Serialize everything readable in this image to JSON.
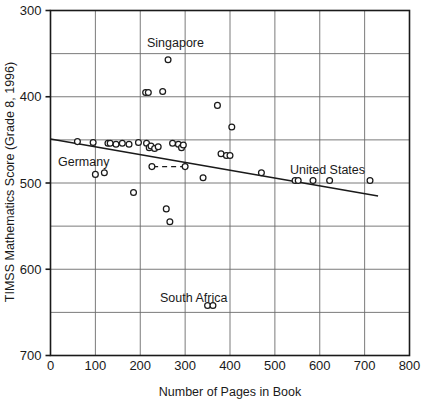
{
  "chart_data": {
    "type": "scatter",
    "title": "",
    "xlabel": "Number of Pages in Book",
    "ylabel": "TIMSS Mathematics Score (Grade 8, 1996)",
    "xlim": [
      0,
      800
    ],
    "ylim": [
      300,
      700
    ],
    "xticks": [
      0,
      100,
      200,
      300,
      400,
      500,
      600,
      700,
      800
    ],
    "yticks": [
      300,
      400,
      500,
      600,
      700
    ],
    "y_minor_gridlines": [
      350,
      450,
      550,
      650
    ],
    "grid": true,
    "legend": "none",
    "point_marker": "open-circle",
    "points": [
      {
        "x": 60,
        "y": 548
      },
      {
        "x": 95,
        "y": 547
      },
      {
        "x": 100,
        "y": 510
      },
      {
        "x": 120,
        "y": 512
      },
      {
        "x": 128,
        "y": 546
      },
      {
        "x": 133,
        "y": 546
      },
      {
        "x": 146,
        "y": 545
      },
      {
        "x": 160,
        "y": 546
      },
      {
        "x": 175,
        "y": 545
      },
      {
        "x": 185,
        "y": 489
      },
      {
        "x": 196,
        "y": 547
      },
      {
        "x": 212,
        "y": 605
      },
      {
        "x": 218,
        "y": 605
      },
      {
        "x": 214,
        "y": 546
      },
      {
        "x": 220,
        "y": 541
      },
      {
        "x": 224,
        "y": 543
      },
      {
        "x": 226,
        "y": 519
      },
      {
        "x": 232,
        "y": 540
      },
      {
        "x": 240,
        "y": 542
      },
      {
        "x": 250,
        "y": 606
      },
      {
        "x": 258,
        "y": 470
      },
      {
        "x": 262,
        "y": 643
      },
      {
        "x": 266,
        "y": 455
      },
      {
        "x": 272,
        "y": 546
      },
      {
        "x": 285,
        "y": 545
      },
      {
        "x": 292,
        "y": 541
      },
      {
        "x": 296,
        "y": 544
      },
      {
        "x": 300,
        "y": 519
      },
      {
        "x": 340,
        "y": 506
      },
      {
        "x": 350,
        "y": 358
      },
      {
        "x": 362,
        "y": 358
      },
      {
        "x": 372,
        "y": 590
      },
      {
        "x": 380,
        "y": 534
      },
      {
        "x": 392,
        "y": 532
      },
      {
        "x": 400,
        "y": 532
      },
      {
        "x": 404,
        "y": 565
      },
      {
        "x": 470,
        "y": 512
      },
      {
        "x": 545,
        "y": 503
      },
      {
        "x": 552,
        "y": 503
      },
      {
        "x": 585,
        "y": 503
      },
      {
        "x": 622,
        "y": 503
      },
      {
        "x": 712,
        "y": 503
      }
    ],
    "trend_line": {
      "style": "solid",
      "x_start": 0,
      "y_start": 551,
      "x_end": 730,
      "y_end": 485
    },
    "reference_lines": [
      {
        "name": "germany-dashed",
        "style": "dashed",
        "x_start": 300,
        "y_start": 519,
        "x_end": 226,
        "y_end": 519
      }
    ],
    "annotations": [
      {
        "id": "singapore",
        "label": "Singapore",
        "x_px": 147,
        "y_px": 47
      },
      {
        "id": "germany",
        "label": "Germany",
        "x_px": 58,
        "y_px": 166
      },
      {
        "id": "united-states",
        "label": "United States",
        "x_px": 290,
        "y_px": 174
      },
      {
        "id": "south-africa",
        "label": "South Africa",
        "x_px": 160,
        "y_px": 302
      }
    ]
  },
  "axes": {
    "x_tick_labels": [
      "0",
      "100",
      "200",
      "300",
      "400",
      "500",
      "600",
      "700",
      "800"
    ],
    "y_tick_labels": [
      "700",
      "600",
      "500",
      "400",
      "300"
    ],
    "x_axis_title": "Number of Pages in Book",
    "y_axis_title": "TIMSS Mathematics Score (Grade 8, 1996)"
  },
  "colors": {
    "background": "#ffffff",
    "axis": "#1a1a1a",
    "gridline": "#6b6b6b",
    "marker_stroke": "#1a1a1a",
    "trend_line": "#1a1a1a",
    "text": "#1a1a1a"
  }
}
